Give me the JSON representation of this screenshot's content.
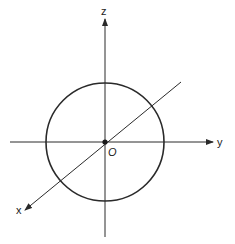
{
  "diagram": {
    "type": "3d-coordinate-axes-with-sphere",
    "colors": {
      "line": "#2a2a2a",
      "background": "#ffffff"
    },
    "origin": {
      "label": "O",
      "x": 105,
      "y": 142
    },
    "axes": {
      "z": {
        "label": "z",
        "from": [
          105,
          237
        ],
        "to": [
          105,
          18
        ]
      },
      "y": {
        "label": "y",
        "from": [
          10,
          142
        ],
        "to": [
          213,
          142
        ]
      },
      "x": {
        "label": "x",
        "from": [
          181,
          82
        ],
        "to": [
          24,
          211
        ]
      }
    },
    "circle": {
      "cx": 105,
      "cy": 142,
      "r": 59
    }
  }
}
